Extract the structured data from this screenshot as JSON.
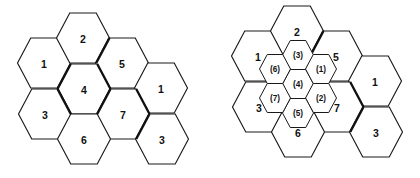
{
  "figure": {
    "background_color": "#ffffff",
    "line_color": "#1a1a1a",
    "bold_line_color": "#111111",
    "label_color": "#111111"
  },
  "panels": [
    {
      "name": "left-cluster",
      "description": "Seven-cell hexagonal cluster with frequency reuse numbers",
      "hex_geometry": {
        "orientation": "flat-top",
        "width": 53,
        "height": 50,
        "dx": 39.5,
        "dy": 25
      },
      "cells": [
        {
          "label": "1",
          "cx": 44,
          "cy": 63,
          "size": "outer"
        },
        {
          "label": "2",
          "cx": 83,
          "cy": 38,
          "size": "outer"
        },
        {
          "label": "5",
          "cx": 122,
          "cy": 63,
          "size": "outer"
        },
        {
          "label": "4",
          "cx": 84,
          "cy": 89,
          "size": "outer"
        },
        {
          "label": "1",
          "cx": 161,
          "cy": 88,
          "size": "outer"
        },
        {
          "label": "3",
          "cx": 45,
          "cy": 114,
          "size": "outer"
        },
        {
          "label": "7",
          "cx": 123,
          "cy": 114,
          "size": "outer"
        },
        {
          "label": "6",
          "cx": 84,
          "cy": 139,
          "size": "outer"
        },
        {
          "label": "3",
          "cx": 162,
          "cy": 139,
          "size": "outer"
        }
      ]
    },
    {
      "name": "right-cluster",
      "description": "Seven-cell hexagonal cluster with a nested smaller seven-cell cluster at the centre, inner cells labelled in parentheses",
      "hex_geometry": {
        "orientation": "flat-top",
        "width": 53,
        "height": 50,
        "dx": 39.5,
        "dy": 25,
        "inner_width": 31,
        "inner_height": 29,
        "inner_dx": 23.2,
        "inner_dy": 14.5
      },
      "cells": [
        {
          "label": "1",
          "cx": 258,
          "cy": 56,
          "size": "outer"
        },
        {
          "label": "2",
          "cx": 297,
          "cy": 31,
          "size": "outer"
        },
        {
          "label": "5",
          "cx": 336,
          "cy": 56,
          "size": "outer"
        },
        {
          "label": "4",
          "cx": 298,
          "cy": 82,
          "size": "outer"
        },
        {
          "label": "1",
          "cx": 375,
          "cy": 81,
          "size": "outer"
        },
        {
          "label": "3",
          "cx": 259,
          "cy": 107,
          "size": "outer"
        },
        {
          "label": "7",
          "cx": 337,
          "cy": 107,
          "size": "outer"
        },
        {
          "label": "6",
          "cx": 298,
          "cy": 132,
          "size": "outer"
        },
        {
          "label": "3",
          "cx": 376,
          "cy": 132,
          "size": "outer"
        }
      ],
      "inner_cells": [
        {
          "label": "(4)",
          "cx": 298,
          "cy": 84
        },
        {
          "label": "(3)",
          "cx": 298,
          "cy": 55
        },
        {
          "label": "(1)",
          "cx": 321,
          "cy": 69
        },
        {
          "label": "(2)",
          "cx": 321,
          "cy": 98
        },
        {
          "label": "(5)",
          "cx": 298,
          "cy": 113
        },
        {
          "label": "(7)",
          "cx": 275,
          "cy": 98
        },
        {
          "label": "(6)",
          "cx": 275,
          "cy": 69
        }
      ]
    }
  ],
  "labels": {
    "outer_sequence": [
      "1",
      "2",
      "3",
      "4",
      "5",
      "6",
      "7"
    ],
    "inner_sequence": [
      "(1)",
      "(2)",
      "(3)",
      "(4)",
      "(5)",
      "(6)",
      "(7)"
    ]
  }
}
